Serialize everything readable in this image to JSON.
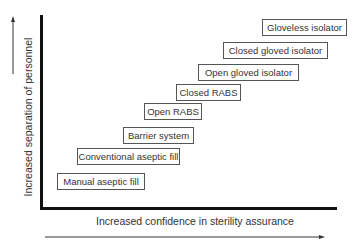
{
  "diagram": {
    "y_axis_label": "Increased separation of personnel",
    "x_axis_label": "Increased confidence in sterility assurance",
    "boxes": [
      {
        "label": "Manual aseptic fill",
        "x": 57,
        "y": 173,
        "w": 88
      },
      {
        "label": "Conventional aseptic fill",
        "x": 77,
        "y": 148,
        "w": 103
      },
      {
        "label": "Barrier system",
        "x": 123,
        "y": 127,
        "w": 71
      },
      {
        "label": "Open RABS",
        "x": 144,
        "y": 103,
        "w": 58
      },
      {
        "label": "Closed RABS",
        "x": 176,
        "y": 84,
        "w": 65
      },
      {
        "label": "Open gloved isolator",
        "x": 198,
        "y": 64,
        "w": 101
      },
      {
        "label": "Closed gloved isolator",
        "x": 223,
        "y": 42,
        "w": 105
      },
      {
        "label": "Gloveless isolator",
        "x": 262,
        "y": 19,
        "w": 85
      }
    ],
    "colors": {
      "axis": "#111111",
      "arrow": "#333333",
      "box_border": "#555555",
      "text": "#333333"
    }
  }
}
